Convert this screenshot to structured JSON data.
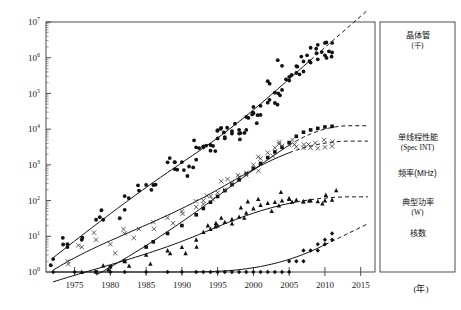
{
  "chart_data": {
    "type": "scatter",
    "title": "",
    "xlabel": "(年)",
    "ylabel": "",
    "xlim": [
      1971,
      2017
    ],
    "ylim": [
      1,
      10000000
    ],
    "yscale": "log",
    "grid": false,
    "legend_position": "right-panel",
    "xticks": [
      "1975",
      "1980",
      "1985",
      "1990",
      "1995",
      "2000",
      "2005",
      "2010",
      "2015"
    ],
    "xtick_values": [
      1975,
      1980,
      1985,
      1990,
      1995,
      2000,
      2005,
      2010,
      2015
    ],
    "ytick_labels": [
      "10",
      "10",
      "10",
      "10",
      "10",
      "10",
      "10",
      "10"
    ],
    "ytick_exponents": [
      "0",
      "1",
      "2",
      "3",
      "4",
      "5",
      "6",
      "7"
    ],
    "ytick_values": [
      1,
      10,
      100,
      1000,
      10000,
      100000,
      1000000,
      10000000
    ],
    "series": [
      {
        "name": "晶体管（千）",
        "legend_line1": "晶体管",
        "legend_line2": "(千)",
        "marker": "filled-circle",
        "trend_solid_end": 2008,
        "trend_dashed_end": 2016,
        "points": [
          [
            1972,
            2.3
          ],
          [
            1974,
            5
          ],
          [
            1974,
            6
          ],
          [
            1976,
            8
          ],
          [
            1978,
            29
          ],
          [
            1979,
            29
          ],
          [
            1982,
            134
          ],
          [
            1982,
            55
          ],
          [
            1984,
            190
          ],
          [
            1985,
            275
          ],
          [
            1986,
            273
          ],
          [
            1988,
            1180
          ],
          [
            1989,
            1200
          ],
          [
            1989,
            1180
          ],
          [
            1990,
            1200
          ],
          [
            1991,
            900
          ],
          [
            1992,
            3100
          ],
          [
            1992,
            1400
          ],
          [
            1993,
            3100
          ],
          [
            1993,
            3300
          ],
          [
            1994,
            3600
          ],
          [
            1994,
            2500
          ],
          [
            1995,
            5500
          ],
          [
            1995,
            9300
          ],
          [
            1996,
            5500
          ],
          [
            1996,
            6000
          ],
          [
            1997,
            7500
          ],
          [
            1997,
            8800
          ],
          [
            1998,
            7500
          ],
          [
            1998,
            9500
          ],
          [
            1999,
            9500
          ],
          [
            1999,
            22000
          ],
          [
            2000,
            42000
          ],
          [
            2000,
            28000
          ],
          [
            2001,
            25000
          ],
          [
            2001,
            45000
          ],
          [
            2002,
            55000
          ],
          [
            2002,
            220000
          ],
          [
            2003,
            54000
          ],
          [
            2003,
            105000
          ],
          [
            2004,
            125000
          ],
          [
            2004,
            592000
          ],
          [
            2005,
            230000
          ],
          [
            2005,
            291000
          ],
          [
            2006,
            376000
          ],
          [
            2006,
            582000
          ],
          [
            2007,
            411000
          ],
          [
            2007,
            789000
          ],
          [
            2008,
            731000
          ],
          [
            2008,
            1900000
          ],
          [
            2009,
            904000
          ],
          [
            2009,
            2300000
          ],
          [
            2010,
            1170000
          ],
          [
            2010,
            2600000
          ],
          [
            2011,
            1400000
          ],
          [
            2011,
            2600000
          ]
        ]
      },
      {
        "name": "单线程性能 (Spec INT)",
        "legend_line1": "单线程性能",
        "legend_line2": "(Spec INT)",
        "marker": "filled-square",
        "trend_solid_end": 2005,
        "trend_dashed_end": 2016,
        "points": [
          [
            1978,
            1
          ],
          [
            1980,
            1.4
          ],
          [
            1982,
            2
          ],
          [
            1985,
            5
          ],
          [
            1986,
            7
          ],
          [
            1988,
            12
          ],
          [
            1990,
            20
          ],
          [
            1992,
            40
          ],
          [
            1993,
            60
          ],
          [
            1994,
            90
          ],
          [
            1995,
            130
          ],
          [
            1996,
            190
          ],
          [
            1997,
            280
          ],
          [
            1998,
            380
          ],
          [
            1999,
            560
          ],
          [
            2000,
            800
          ],
          [
            2001,
            1100
          ],
          [
            2002,
            1600
          ],
          [
            2003,
            2300
          ],
          [
            2004,
            3100
          ],
          [
            2005,
            4200
          ],
          [
            2006,
            6300
          ],
          [
            2007,
            8200
          ],
          [
            2008,
            9500
          ],
          [
            2009,
            10500
          ],
          [
            2010,
            11500
          ],
          [
            2011,
            12000
          ]
        ]
      },
      {
        "name": "频率(MHz)",
        "legend_line1": "频率(MHz)",
        "legend_line2": "",
        "marker": "cross",
        "trend_solid_end": 2005,
        "trend_dashed_end": 2016,
        "points": [
          [
            1972,
            0.7
          ],
          [
            1974,
            2
          ],
          [
            1976,
            5
          ],
          [
            1978,
            8
          ],
          [
            1980,
            6
          ],
          [
            1982,
            12
          ],
          [
            1984,
            16
          ],
          [
            1986,
            25
          ],
          [
            1988,
            33
          ],
          [
            1990,
            50
          ],
          [
            1992,
            66
          ],
          [
            1993,
            100
          ],
          [
            1994,
            133
          ],
          [
            1995,
            166
          ],
          [
            1996,
            200
          ],
          [
            1997,
            300
          ],
          [
            1998,
            450
          ],
          [
            1999,
            600
          ],
          [
            2000,
            1000
          ],
          [
            2001,
            1500
          ],
          [
            2002,
            2200
          ],
          [
            2003,
            3000
          ],
          [
            2004,
            3400
          ],
          [
            2005,
            3600
          ],
          [
            2006,
            3200
          ],
          [
            2007,
            3000
          ],
          [
            2008,
            3000
          ],
          [
            2009,
            2900
          ],
          [
            2010,
            3100
          ],
          [
            2011,
            3300
          ]
        ]
      },
      {
        "name": "典型功率 (W)",
        "legend_line1": "典型功率",
        "legend_line2": "(W)",
        "marker": "filled-triangle",
        "trend_solid_end": 2006,
        "trend_dashed_end": 2016,
        "points": [
          [
            1972,
            0.5
          ],
          [
            1976,
            1
          ],
          [
            1979,
            1.5
          ],
          [
            1982,
            2
          ],
          [
            1985,
            3
          ],
          [
            1988,
            4
          ],
          [
            1990,
            5
          ],
          [
            1992,
            8
          ],
          [
            1993,
            13
          ],
          [
            1994,
            16
          ],
          [
            1995,
            20
          ],
          [
            1996,
            25
          ],
          [
            1997,
            30
          ],
          [
            1998,
            35
          ],
          [
            1999,
            45
          ],
          [
            2000,
            60
          ],
          [
            2001,
            75
          ],
          [
            2002,
            85
          ],
          [
            2003,
            90
          ],
          [
            2004,
            100
          ],
          [
            2005,
            110
          ],
          [
            2006,
            105
          ],
          [
            2007,
            95
          ],
          [
            2008,
            100
          ],
          [
            2009,
            95
          ],
          [
            2010,
            100
          ],
          [
            2011,
            105
          ]
        ]
      },
      {
        "name": "核数",
        "legend_line1": "核数",
        "legend_line2": "",
        "marker": "filled-diamond",
        "trend_solid_end": 2010,
        "trend_dashed_end": 2016,
        "points": [
          [
            1972,
            1
          ],
          [
            1975,
            1
          ],
          [
            1978,
            1
          ],
          [
            1980,
            1
          ],
          [
            1982,
            1
          ],
          [
            1985,
            1
          ],
          [
            1988,
            1
          ],
          [
            1990,
            1
          ],
          [
            1992,
            1
          ],
          [
            1993,
            1
          ],
          [
            1994,
            1
          ],
          [
            1995,
            1
          ],
          [
            1996,
            1
          ],
          [
            1997,
            1
          ],
          [
            1998,
            1
          ],
          [
            1999,
            1
          ],
          [
            2000,
            1
          ],
          [
            2001,
            1
          ],
          [
            2002,
            1
          ],
          [
            2003,
            1
          ],
          [
            2004,
            1
          ],
          [
            2005,
            1
          ],
          [
            2005,
            2
          ],
          [
            2006,
            2
          ],
          [
            2007,
            2
          ],
          [
            2007,
            4
          ],
          [
            2008,
            4
          ],
          [
            2009,
            4
          ],
          [
            2009,
            6
          ],
          [
            2010,
            6
          ],
          [
            2010,
            8
          ],
          [
            2011,
            8
          ],
          [
            2011,
            12
          ]
        ]
      }
    ]
  },
  "axes": {
    "x_unit_label": "(年)"
  },
  "legend": {
    "items": [
      {
        "line1": "晶体管",
        "line2": "(千)"
      },
      {
        "line1": "单线程性能",
        "line2": "(Spec INT)"
      },
      {
        "line1": "频率(MHz)",
        "line2": ""
      },
      {
        "line1": "典型功率",
        "line2": "(W)"
      },
      {
        "line1": "核数",
        "line2": ""
      }
    ]
  }
}
